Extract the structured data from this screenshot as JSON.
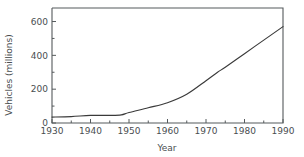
{
  "chart_data": {
    "type": "line",
    "title": "",
    "xlabel": "Year",
    "ylabel": "Vehicles (millions)",
    "xlim": [
      1930,
      1990
    ],
    "ylim": [
      0,
      680
    ],
    "grid": false,
    "legend": "none",
    "x_ticks": [
      1930,
      1940,
      1950,
      1960,
      1970,
      1980,
      1990
    ],
    "x_tick_labels": [
      "1930",
      "1940",
      "1950",
      "1960",
      "1970",
      "1980",
      "1990"
    ],
    "x_minor_ticks": [
      1935,
      1945,
      1955,
      1965,
      1975,
      1985
    ],
    "y_ticks": [
      0,
      200,
      400,
      600
    ],
    "y_tick_labels": [
      "0",
      "200",
      "400",
      "600"
    ],
    "y_minor_ticks": [
      100,
      300,
      500
    ],
    "series": [
      {
        "name": "Vehicles",
        "color": "#3a3a3a",
        "x": [
          1930,
          1935,
          1940,
          1945,
          1948,
          1950,
          1955,
          1960,
          1965,
          1970,
          1973,
          1975,
          1980,
          1985,
          1990
        ],
        "values": [
          35,
          38,
          45,
          45,
          48,
          62,
          90,
          120,
          170,
          250,
          300,
          330,
          410,
          490,
          570
        ]
      }
    ]
  },
  "axis": {
    "y_title": "Vehicles (millions)",
    "x_title": "Year"
  }
}
